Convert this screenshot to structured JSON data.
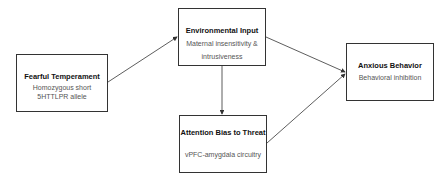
{
  "nodes": {
    "fearful": {
      "title": "Fearful Temperament",
      "subtitle": "Homozygous short 5HTTLPR allele"
    },
    "environmental": {
      "title": "Environmental Input",
      "subtitle": "Maternal insensitivity & intrusiveness"
    },
    "attention": {
      "title": "Attention Bias to Threat",
      "subtitle": "vPFC-amygdala circuitry"
    },
    "anxious": {
      "title": "Anxious Behavior",
      "subtitle": "Behavioral inhibition"
    }
  },
  "edges": [
    {
      "from": "fearful",
      "to": "environmental"
    },
    {
      "from": "environmental",
      "to": "anxious"
    },
    {
      "from": "environmental",
      "to": "attention"
    },
    {
      "from": "attention",
      "to": "anxious"
    }
  ],
  "colors": {
    "line": "#333333",
    "title": "#111111",
    "subtitle": "#555555"
  }
}
